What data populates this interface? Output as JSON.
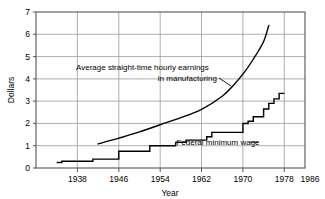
{
  "chart_data": {
    "type": "line",
    "title": "",
    "xlabel": "Year",
    "ylabel": "Dollars",
    "xlim": [
      1934,
      1986
    ],
    "ylim": [
      0,
      7
    ],
    "xticks": [
      1938,
      1946,
      1954,
      1962,
      1970,
      1978,
      1986
    ],
    "xtick_labels": [
      "1938",
      "1946",
      "1954",
      "1962",
      "1970",
      "1978",
      "1986"
    ],
    "yticks": [
      0,
      1,
      2,
      3,
      4,
      5,
      6,
      7
    ],
    "ytick_labels": [
      "0",
      "1",
      "2",
      "3",
      "4",
      "5",
      "6",
      "7"
    ],
    "grid": true,
    "legend": "none",
    "annotations": [
      {
        "name": "earnings-label",
        "line1": "Average straight-time hourly earnings",
        "line2": "in manufacturing"
      },
      {
        "name": "minimum-wage-label",
        "text": "Federal minimum wage"
      }
    ],
    "series": [
      {
        "name": "Average straight-time hourly earnings in manufacturing",
        "type": "line",
        "style": "smooth-curve",
        "color": "#000000",
        "points": [
          {
            "x": 1946,
            "y": 1.08
          },
          {
            "x": 1950,
            "y": 1.34
          },
          {
            "x": 1954,
            "y": 1.62
          },
          {
            "x": 1958,
            "y": 1.94
          },
          {
            "x": 1962,
            "y": 2.26
          },
          {
            "x": 1966,
            "y": 2.63
          },
          {
            "x": 1970,
            "y": 3.22
          },
          {
            "x": 1972,
            "y": 3.67
          },
          {
            "x": 1974,
            "y": 4.21
          },
          {
            "x": 1976,
            "y": 4.88
          },
          {
            "x": 1978,
            "y": 5.68
          },
          {
            "x": 1979,
            "y": 6.4
          }
        ]
      },
      {
        "name": "Federal minimum wage",
        "type": "step",
        "style": "step-post",
        "color": "#000000",
        "points": [
          {
            "x": 1938,
            "y": 0.25
          },
          {
            "x": 1939,
            "y": 0.3
          },
          {
            "x": 1945,
            "y": 0.4
          },
          {
            "x": 1950,
            "y": 0.75
          },
          {
            "x": 1956,
            "y": 1.0
          },
          {
            "x": 1961,
            "y": 1.15
          },
          {
            "x": 1963,
            "y": 1.25
          },
          {
            "x": 1967,
            "y": 1.4
          },
          {
            "x": 1968,
            "y": 1.6
          },
          {
            "x": 1974,
            "y": 2.0
          },
          {
            "x": 1975,
            "y": 2.1
          },
          {
            "x": 1976,
            "y": 2.3
          },
          {
            "x": 1978,
            "y": 2.65
          },
          {
            "x": 1979,
            "y": 2.9
          },
          {
            "x": 1980,
            "y": 3.1
          },
          {
            "x": 1981,
            "y": 3.35
          },
          {
            "x": 1982,
            "y": 3.35
          }
        ]
      }
    ]
  },
  "colors": {
    "grid": "#9a9a9a",
    "frame": "#555555",
    "data": "#000000",
    "background": "#ffffff"
  }
}
